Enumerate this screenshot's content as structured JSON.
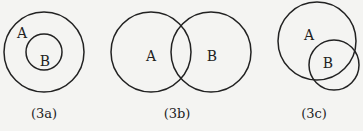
{
  "diagrams": [
    {
      "id": "3a",
      "caption": "(3a)",
      "relation": "B is a subset of A (B inside A)",
      "sets": [
        {
          "label": "A",
          "cx": 44,
          "cy": 52,
          "r": 40,
          "label_x": 22,
          "label_y": 38
        },
        {
          "label": "B",
          "cx": 44,
          "cy": 52,
          "r": 18,
          "label_x": 44,
          "label_y": 66
        }
      ]
    },
    {
      "id": "3b",
      "caption": "(3b)",
      "relation": "A and B partially overlap",
      "sets": [
        {
          "label": "A",
          "cx": 151,
          "cy": 52,
          "r": 40,
          "label_x": 151,
          "label_y": 61
        },
        {
          "label": "B",
          "cx": 211,
          "cy": 52,
          "r": 40,
          "label_x": 212,
          "label_y": 61
        }
      ]
    },
    {
      "id": "3c",
      "caption": "(3c)",
      "relation": "B mostly inside A, extending beyond its edge",
      "sets": [
        {
          "label": "A",
          "cx": 317,
          "cy": 41,
          "r": 39,
          "label_x": 309,
          "label_y": 40
        },
        {
          "label": "B",
          "cx": 334,
          "cy": 65,
          "r": 25,
          "label_x": 328,
          "label_y": 67
        }
      ]
    }
  ],
  "captions": {
    "a": "(3a)",
    "b": "(3b)",
    "c": "(3c)"
  },
  "labels": {
    "a_A": "A",
    "a_B": "B",
    "b_A": "A",
    "b_B": "B",
    "c_A": "A",
    "c_B": "B"
  }
}
